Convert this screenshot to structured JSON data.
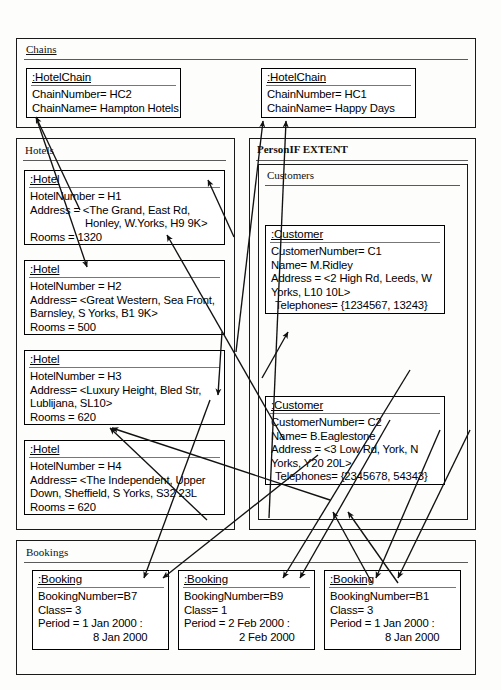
{
  "diagram": {
    "type": "uml-object-diagram",
    "line_color": "#111111",
    "packages": [
      {
        "key": "chains",
        "title": "Chains"
      },
      {
        "key": "hotels",
        "title": "Hotels"
      },
      {
        "key": "personif",
        "title": "PersonIF EXTENT"
      },
      {
        "key": "customers",
        "title": "Customers"
      },
      {
        "key": "bookings",
        "title": "Bookings"
      }
    ]
  },
  "chains": {
    "title": "Chains",
    "objects": [
      {
        "name": ":HotelChain",
        "attrs": [
          "ChainNumber= HC2",
          "ChainName= Hampton Hotels"
        ]
      },
      {
        "name": ":HotelChain",
        "attrs": [
          "ChainNumber= HC1",
          "ChainName= Happy Days"
        ]
      }
    ]
  },
  "hotels": {
    "title": "Hotels",
    "objects": [
      {
        "name": ":Hotel",
        "attrs": [
          "HotelNumber = H1",
          "Address = <The Grand, East Rd,",
          "Honley, W.Yorks, H9 9K>",
          "Rooms = 1320"
        ]
      },
      {
        "name": ":Hotel",
        "attrs": [
          "HotelNumber = H2",
          "Address= <Great Western, Sea Front,",
          "Barnsley, S Yorks, B1 9K>",
          "Rooms = 500"
        ]
      },
      {
        "name": ":Hotel",
        "attrs": [
          "HotelNumber = H3",
          "Address= <Luxury Height, Bled Str,",
          "Lublijana, SL10>",
          "Rooms = 620"
        ]
      },
      {
        "name": ":Hotel",
        "attrs": [
          "HotelNumber = H4",
          "Address= <The Independent, Upper",
          "Down, Sheffield, S Yorks, S32 23L",
          "Rooms = 620"
        ]
      }
    ]
  },
  "personif": {
    "title": "PersonIF EXTENT"
  },
  "customers": {
    "title": "Customers",
    "objects": [
      {
        "name": ":Customer",
        "attrs": [
          "CustomerNumber= C1",
          "Name= M.Ridley",
          "Address = <2 High Rd, Leeds, W",
          "Yorks, L10 10L>",
          "Telephones= {1234567, 13243}"
        ]
      },
      {
        "name": ":Customer",
        "attrs": [
          "CustomerNumber= C2",
          "Name= B.Eaglestone",
          "Address = <3 Low Rd, York, N",
          "Yorks, Y20 20L>",
          "Telephones= {2345678, 54343}"
        ]
      }
    ]
  },
  "bookings": {
    "title": "Bookings",
    "objects": [
      {
        "name": ":Booking",
        "attrs": [
          "BookingNumber=B7",
          "Class= 3",
          "Period = 1 Jan 2000 :",
          "8 Jan 2000"
        ]
      },
      {
        "name": ":Booking",
        "attrs": [
          "BookingNumber=B9",
          "Class= 1",
          "Period = 2 Feb 2000 :",
          "2 Feb 2000"
        ]
      },
      {
        "name": ":Booking",
        "attrs": [
          "BookingNumber=B1",
          "Class= 3",
          "Period = 1 Jan 2000 :",
          "8 Jan 2000"
        ]
      }
    ]
  }
}
